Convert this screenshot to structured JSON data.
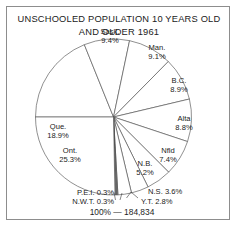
{
  "figure": {
    "title_line1": "UNSCHOOLED POPULATION 10 YEARS OLD",
    "title_line2": "AND OLDER 1961",
    "total_label": "100% — 184,834"
  },
  "chart_data": {
    "type": "pie",
    "title": "UNSCHOOLED POPULATION 10 YEARS OLD AND OLDER 1961",
    "subtitle": "",
    "xlabel": "",
    "ylabel": "",
    "total": "184,834",
    "total_label": "100% — 184,834",
    "units": "percent",
    "start_angle_deg": 180,
    "direction": "clockwise",
    "legend": "none (labels placed on slices)",
    "grid": false,
    "categories": [
      "Que.",
      "Sask.",
      "Man.",
      "B.C.",
      "Alta",
      "Nfld",
      "N.B.",
      "N.S.",
      "Y.T.",
      "P.E.I.",
      "N.W.T.",
      "Ont."
    ],
    "values": [
      18.9,
      9.4,
      9.1,
      8.9,
      8.8,
      7.4,
      5.2,
      3.6,
      2.8,
      0.3,
      0.3,
      25.3
    ],
    "slices": [
      {
        "name": "Que.",
        "value": 18.9,
        "label": "Que.",
        "value_label": "18.9%",
        "lines": [
          "Que.",
          "18.9%"
        ],
        "fill": "#ffffff"
      },
      {
        "name": "Sask.",
        "value": 9.4,
        "label": "Sask.",
        "value_label": "9.4%",
        "lines": [
          "Sask.",
          "9.4%"
        ],
        "fill": "#ffffff"
      },
      {
        "name": "Man.",
        "value": 9.1,
        "label": "Man.",
        "value_label": "9.1%",
        "lines": [
          "Man.",
          "9.1%"
        ],
        "fill": "#ffffff"
      },
      {
        "name": "B.C.",
        "value": 8.9,
        "label": "B.C.",
        "value_label": "8.9%",
        "lines": [
          "B.C.",
          "8.9%"
        ],
        "fill": "#ffffff"
      },
      {
        "name": "Alta",
        "value": 8.8,
        "label": "Alta",
        "value_label": "8.8%",
        "lines": [
          "Alta",
          "8.8%"
        ],
        "fill": "#ffffff"
      },
      {
        "name": "Nfld",
        "value": 7.4,
        "label": "Nfld",
        "value_label": "7.4%",
        "lines": [
          "Nfld",
          "7.4%"
        ],
        "fill": "#ffffff"
      },
      {
        "name": "N.B.",
        "value": 5.2,
        "label": "N.B.",
        "value_label": "5.2%",
        "lines": [
          "N.B.",
          "5.2%"
        ],
        "fill": "#ffffff"
      },
      {
        "name": "N.S.",
        "value": 3.6,
        "label": "N.S.",
        "value_label": "3.6%",
        "lines": [
          "N.S. 3.6%"
        ],
        "fill": "#ffffff"
      },
      {
        "name": "Y.T.",
        "value": 2.8,
        "label": "Y.T.",
        "value_label": "2.8%",
        "lines": [
          "Y.T. 2.8%"
        ],
        "fill": "#ffffff"
      },
      {
        "name": "P.E.I.",
        "value": 0.3,
        "label": "P.E.I.",
        "value_label": "0.3%",
        "lines": [
          "P.E.I. 0.3%"
        ],
        "fill": "#8a8a8a"
      },
      {
        "name": "N.W.T.",
        "value": 0.3,
        "label": "N.W.T.",
        "value_label": "0.3%",
        "lines": [
          "N.W.T. 0.3%"
        ],
        "fill": "#8a8a8a"
      },
      {
        "name": "Ont.",
        "value": 25.3,
        "label": "Ont.",
        "value_label": "25.3%",
        "lines": [
          "Ont.",
          "25.3%"
        ],
        "fill": "#ffffff"
      }
    ],
    "callout_labels": [
      {
        "name": "P.E.I.",
        "text": "P.E.I. 0.3%"
      },
      {
        "name": "N.W.T.",
        "text": "N.W.T. 0.3%"
      },
      {
        "name": "Y.T.",
        "text": "Y.T. 2.8%"
      },
      {
        "name": "N.S.",
        "text": "N.S. 3.6%"
      }
    ]
  },
  "labels": {
    "que_name": "Que.",
    "que_pct": "18.9%",
    "sask_name": "Sask.",
    "sask_pct": "9.4%",
    "man_name": "Man.",
    "man_pct": "9.1%",
    "bc_name": "B.C.",
    "bc_pct": "8.9%",
    "alta_name": "Alta",
    "alta_pct": "8.8%",
    "nfld_name": "Nfld",
    "nfld_pct": "7.4%",
    "nb_name": "N.B.",
    "nb_pct": "5.2%",
    "ont_name": "Ont.",
    "ont_pct": "25.3%",
    "ns_full": "N.S. 3.6%",
    "yt_full": "Y.T. 2.8%",
    "pei_full": "P.E.I. 0.3%",
    "nwt_full": "N.W.T. 0.3%"
  }
}
